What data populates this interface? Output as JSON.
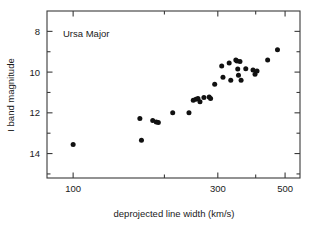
{
  "figure": {
    "annotation": "Ursa Major",
    "background_color": "#ffffff",
    "marker_color": "#111111",
    "axis_color": "#3a3a3a"
  },
  "chart_data": {
    "type": "scatter",
    "title": "",
    "annotation": "Ursa Major",
    "xlabel": "deprojected line width  (km/s)",
    "ylabel": "I band magnitude",
    "xscale": "log",
    "yscale": "linear",
    "xlim": [
      82,
      560
    ],
    "ylim": [
      15.2,
      7.0
    ],
    "y_inverted": true,
    "grid": false,
    "legend": null,
    "xticks": [
      100,
      300,
      500
    ],
    "xtick_labels": [
      "100",
      "300",
      "500"
    ],
    "xticks_minor": [
      200,
      400
    ],
    "yticks": [
      8,
      10,
      12,
      14
    ],
    "ytick_labels": [
      "8",
      "10",
      "12",
      "14"
    ],
    "series": [
      {
        "name": "Ursa Major galaxies",
        "marker": "filled-circle",
        "points": [
          {
            "x": 100,
            "y": 13.55
          },
          {
            "x": 168,
            "y": 13.35
          },
          {
            "x": 166,
            "y": 12.28
          },
          {
            "x": 183,
            "y": 12.38
          },
          {
            "x": 188,
            "y": 12.45
          },
          {
            "x": 191,
            "y": 12.47
          },
          {
            "x": 213,
            "y": 12.0
          },
          {
            "x": 241,
            "y": 12.0
          },
          {
            "x": 249,
            "y": 11.38
          },
          {
            "x": 254,
            "y": 11.33
          },
          {
            "x": 258,
            "y": 11.3
          },
          {
            "x": 262,
            "y": 11.45
          },
          {
            "x": 270,
            "y": 11.25
          },
          {
            "x": 281,
            "y": 11.22
          },
          {
            "x": 284,
            "y": 11.3
          },
          {
            "x": 293,
            "y": 10.6
          },
          {
            "x": 309,
            "y": 9.7
          },
          {
            "x": 312,
            "y": 10.25
          },
          {
            "x": 327,
            "y": 9.55
          },
          {
            "x": 331,
            "y": 10.4
          },
          {
            "x": 344,
            "y": 9.4
          },
          {
            "x": 347,
            "y": 9.45
          },
          {
            "x": 349,
            "y": 9.85
          },
          {
            "x": 351,
            "y": 10.15
          },
          {
            "x": 355,
            "y": 9.48
          },
          {
            "x": 358,
            "y": 10.4
          },
          {
            "x": 371,
            "y": 9.83
          },
          {
            "x": 392,
            "y": 9.9
          },
          {
            "x": 398,
            "y": 10.1
          },
          {
            "x": 404,
            "y": 9.95
          },
          {
            "x": 438,
            "y": 9.4
          },
          {
            "x": 472,
            "y": 8.9
          }
        ]
      }
    ]
  }
}
